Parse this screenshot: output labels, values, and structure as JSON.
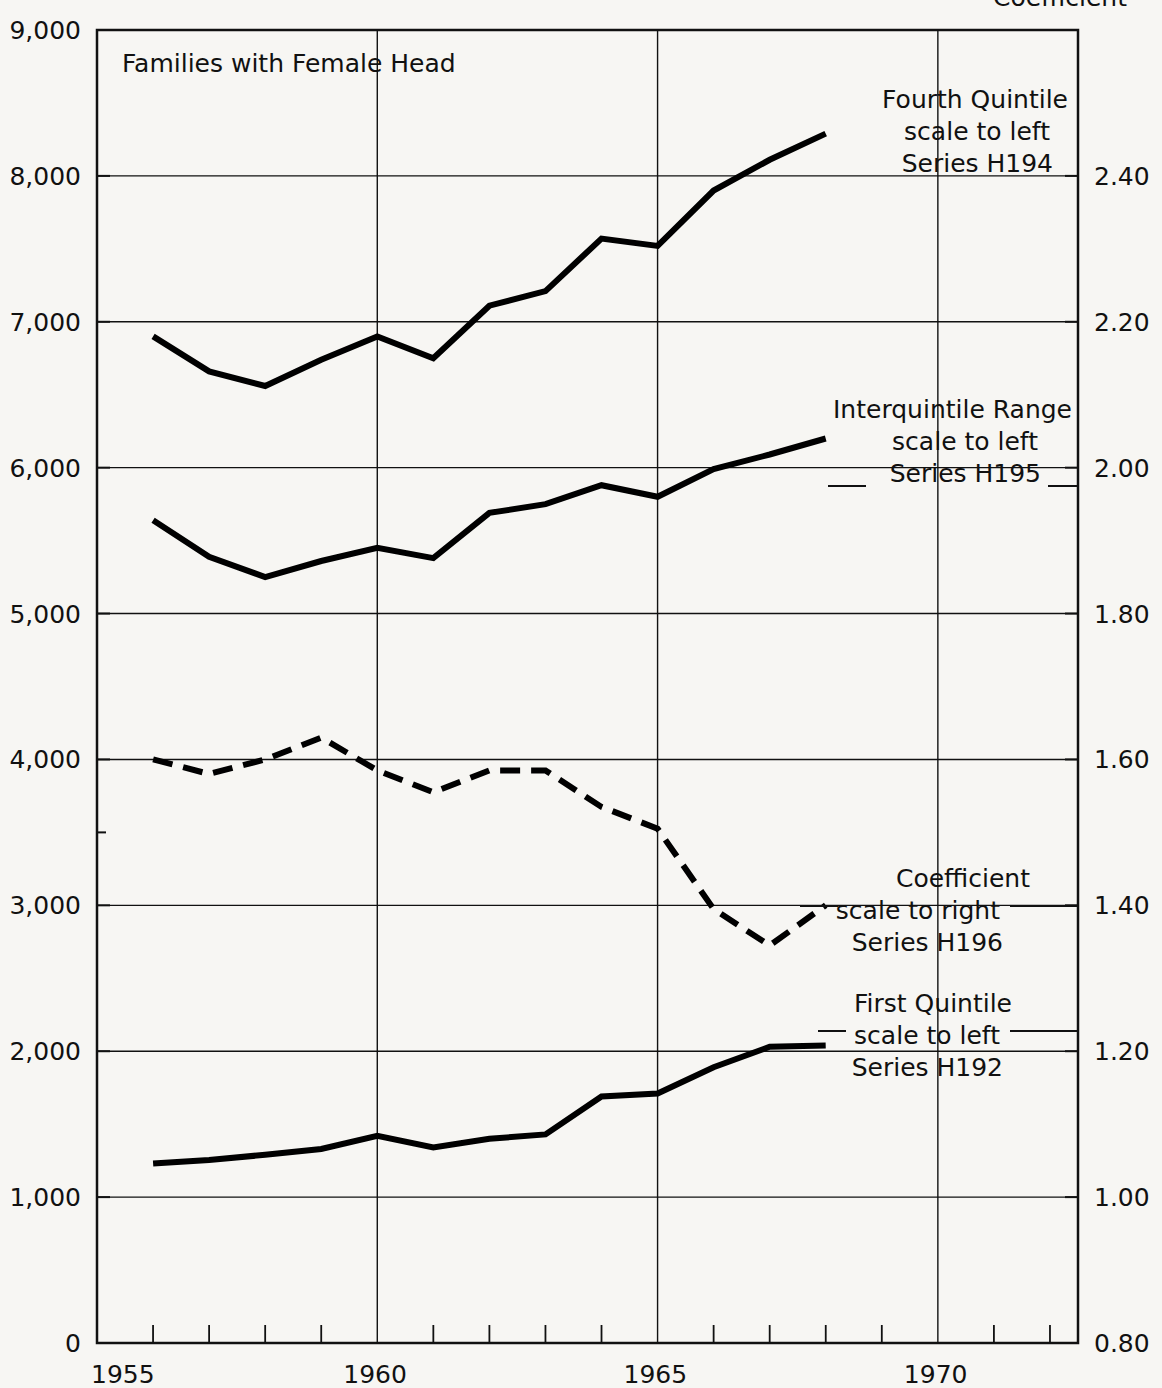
{
  "figure": {
    "plot_title": "Families with Female Head",
    "top_cut_label": "Coefficient"
  },
  "chart_data": {
    "type": "line",
    "title": "Families with Female Head",
    "xlabel": "",
    "ylabel": "",
    "grid": true,
    "legend_position": "inline-annotations",
    "x_axis": {
      "ticks": [
        "1955",
        "1960",
        "1965",
        "1970"
      ],
      "tick_values": [
        1955,
        1960,
        1965,
        1970
      ],
      "range": [
        1955,
        1972.5
      ],
      "minor_tick_interval": 1
    },
    "y_axis_left": {
      "ticks": [
        "0",
        "1,000",
        "2,000",
        "3,000",
        "4,000",
        "5,000",
        "6,000",
        "7,000",
        "8,000",
        "9,000"
      ],
      "tick_values": [
        0,
        1000,
        2000,
        3000,
        4000,
        5000,
        6000,
        7000,
        8000,
        9000
      ],
      "range": [
        0,
        9000
      ]
    },
    "y_axis_right": {
      "ticks": [
        "0.80",
        "1.00",
        "1.20",
        "1.40",
        "1.60",
        "1.80",
        "2.00",
        "2.20",
        "2.40"
      ],
      "tick_values": [
        0.8,
        1.0,
        1.2,
        1.4,
        1.6,
        1.8,
        2.0,
        2.2,
        2.4
      ],
      "range": [
        0.8,
        2.6
      ]
    },
    "x": [
      1956,
      1957,
      1958,
      1959,
      1960,
      1961,
      1962,
      1963,
      1964,
      1965,
      1966,
      1967,
      1968
    ],
    "series": [
      {
        "name": "Fourth Quintile",
        "series_id": "H194",
        "scale": "left",
        "style": "solid",
        "color": "#000000",
        "values": [
          6900,
          6660,
          6560,
          6740,
          6900,
          6750,
          7110,
          7210,
          7570,
          7520,
          7900,
          8110,
          8290
        ]
      },
      {
        "name": "Interquintile Range",
        "series_id": "H195",
        "scale": "left",
        "style": "solid",
        "color": "#000000",
        "values": [
          5640,
          5390,
          5250,
          5360,
          5450,
          5380,
          5690,
          5750,
          5880,
          5800,
          5990,
          6090,
          6200
        ]
      },
      {
        "name": "Coefficient",
        "series_id": "H196",
        "scale": "right",
        "style": "dashed",
        "color": "#000000",
        "values": [
          1.6,
          1.58,
          1.6,
          1.63,
          1.585,
          1.555,
          1.585,
          1.585,
          1.535,
          1.505,
          1.395,
          1.345,
          1.4
        ]
      },
      {
        "name": "First Quintile",
        "series_id": "H192",
        "scale": "left",
        "style": "solid",
        "color": "#000000",
        "values": [
          1230,
          1255,
          1290,
          1330,
          1420,
          1340,
          1400,
          1430,
          1690,
          1710,
          1890,
          2030,
          2040
        ]
      }
    ],
    "annotations": [
      {
        "id": "fourth-quintile",
        "line1": "Fourth Quintile",
        "line2": "scale to left",
        "line3": "Series H194"
      },
      {
        "id": "interquintile-range",
        "line1": "Interquintile Range",
        "line2": "scale to left",
        "line3": "Series H195"
      },
      {
        "id": "coefficient",
        "line1": "Coefficient",
        "line2": "scale to right",
        "line3": "Series H196"
      },
      {
        "id": "first-quintile",
        "line1": "First Quintile",
        "line2": "scale to left",
        "line3": "Series H192"
      }
    ]
  }
}
